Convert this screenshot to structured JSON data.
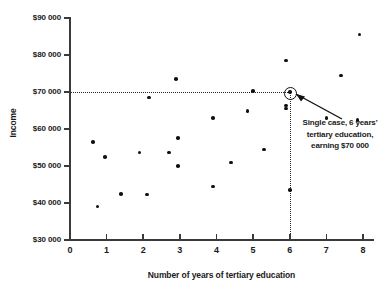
{
  "chart_data": {
    "type": "scatter",
    "title": "",
    "xlabel": "Number of years of tertiary education",
    "ylabel": "Income",
    "xlim": [
      0,
      8.5
    ],
    "ylim": [
      30000,
      90000
    ],
    "xticks": [
      "0",
      "1",
      "2",
      "3",
      "4",
      "5",
      "6",
      "7",
      "8"
    ],
    "xtick_values": [
      0,
      1,
      2,
      3,
      4,
      5,
      6,
      7,
      8
    ],
    "yticks": [
      "$30 000",
      "$40 000",
      "$50 000",
      "$60 000",
      "$70 000",
      "$80 000",
      "$90 000"
    ],
    "ytick_values": [
      30000,
      40000,
      50000,
      60000,
      70000,
      80000,
      90000
    ],
    "grid": false,
    "legend": null,
    "marker_color": "#111111",
    "axis_color": "#3a3a3a",
    "points": [
      {
        "x": 0.63,
        "y": 56500
      },
      {
        "x": 0.75,
        "y": 39000
      },
      {
        "x": 0.96,
        "y": 52400
      },
      {
        "x": 1.4,
        "y": 42500
      },
      {
        "x": 1.9,
        "y": 53700
      },
      {
        "x": 2.1,
        "y": 42300
      },
      {
        "x": 2.7,
        "y": 53700
      },
      {
        "x": 2.9,
        "y": 73500
      },
      {
        "x": 2.95,
        "y": 57500
      },
      {
        "x": 2.95,
        "y": 50000
      },
      {
        "x": 3.9,
        "y": 63000
      },
      {
        "x": 3.9,
        "y": 44500
      },
      {
        "x": 4.4,
        "y": 51000
      },
      {
        "x": 4.85,
        "y": 64800
      },
      {
        "x": 5.0,
        "y": 70200
      },
      {
        "x": 5.3,
        "y": 54500
      },
      {
        "x": 5.9,
        "y": 78500
      },
      {
        "x": 5.9,
        "y": 66400
      },
      {
        "x": 5.9,
        "y": 65500
      },
      {
        "x": 6.0,
        "y": 70000
      },
      {
        "x": 6.0,
        "y": 43500
      },
      {
        "x": 7.0,
        "y": 63000
      },
      {
        "x": 7.4,
        "y": 74500
      },
      {
        "x": 7.85,
        "y": 62500
      },
      {
        "x": 7.9,
        "y": 85500
      },
      {
        "x": 2.15,
        "y": 68500
      }
    ],
    "highlight": {
      "x": 6,
      "y": 70000,
      "guide_x_from": 0,
      "guide_y_from": 30000
    },
    "annotation": {
      "line1": "Single case, 6 years'",
      "line2": "tertiary education,",
      "line3": "earning $70 000"
    }
  }
}
